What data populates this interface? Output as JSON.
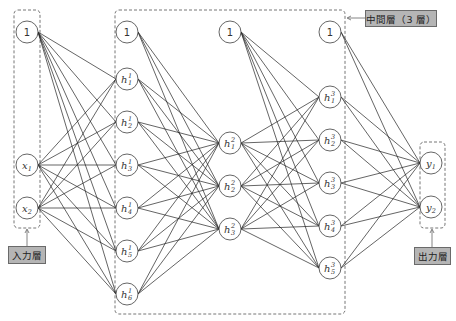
{
  "labels": {
    "input_layer": "入力層",
    "hidden_layers": "中間層（3 層）",
    "output_layer": "出力層"
  },
  "layers": [
    {
      "name": "input",
      "x": 27,
      "bias": {
        "label": "1",
        "y": 32
      },
      "nodes": [
        {
          "base": "x",
          "sub": "1",
          "sup": "",
          "y": 165
        },
        {
          "base": "x",
          "sub": "2",
          "sup": "",
          "y": 208
        }
      ]
    },
    {
      "name": "hidden1",
      "x": 127,
      "bias": {
        "label": "1",
        "y": 32
      },
      "nodes": [
        {
          "base": "h",
          "sub": "1",
          "sup": "1",
          "y": 79
        },
        {
          "base": "h",
          "sub": "2",
          "sup": "1",
          "y": 122
        },
        {
          "base": "h",
          "sub": "3",
          "sup": "1",
          "y": 165
        },
        {
          "base": "h",
          "sub": "4",
          "sup": "1",
          "y": 208
        },
        {
          "base": "h",
          "sub": "5",
          "sup": "1",
          "y": 251
        },
        {
          "base": "h",
          "sub": "6",
          "sup": "1",
          "y": 294
        }
      ]
    },
    {
      "name": "hidden2",
      "x": 230,
      "bias": {
        "label": "1",
        "y": 32
      },
      "nodes": [
        {
          "base": "h",
          "sub": "1",
          "sup": "2",
          "y": 143
        },
        {
          "base": "h",
          "sub": "2",
          "sup": "2",
          "y": 186
        },
        {
          "base": "h",
          "sub": "3",
          "sup": "2",
          "y": 229
        }
      ]
    },
    {
      "name": "hidden3",
      "x": 330,
      "bias": {
        "label": "1",
        "y": 32
      },
      "nodes": [
        {
          "base": "h",
          "sub": "1",
          "sup": "3",
          "y": 97
        },
        {
          "base": "h",
          "sub": "2",
          "sup": "3",
          "y": 140
        },
        {
          "base": "h",
          "sub": "3",
          "sup": "3",
          "y": 183
        },
        {
          "base": "h",
          "sub": "4",
          "sup": "3",
          "y": 226
        },
        {
          "base": "h",
          "sub": "5",
          "sup": "3",
          "y": 268
        }
      ]
    },
    {
      "name": "output",
      "x": 431,
      "bias": null,
      "nodes": [
        {
          "base": "y",
          "sub": "1",
          "sup": "",
          "y": 163
        },
        {
          "base": "y",
          "sub": "2",
          "sup": "",
          "y": 207
        }
      ]
    }
  ],
  "colors": {
    "label_fill": "#b5b5b5",
    "edge": "#222222",
    "node_stroke": "#555555",
    "box_stroke": "#666666"
  }
}
